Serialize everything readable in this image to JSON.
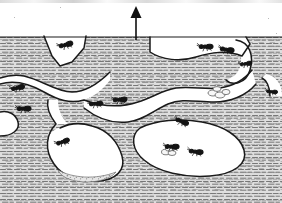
{
  "figure": {
    "width": 282,
    "height": 203,
    "background_color": "#ffffff",
    "soil_fill_color": "#d9d9d9",
    "soil_hatch_color": "#6e6e6e",
    "outline_color": "#1a1a1a",
    "ant_color": "#141414",
    "brood_color": "#f2f2f2",
    "debris_color": "#8a8a8a"
  },
  "annotations": {
    "direction_arrow": {
      "name": "up-arrow",
      "label": "",
      "meaning": "up / toward surface",
      "x": 136,
      "y_tip": 7,
      "y_tail": 40,
      "color": "#101010"
    }
  },
  "soil": {
    "surface_y": 37,
    "texture": "short horizontal dash hatching",
    "regions_note": "Excavated galleries and chambers appear as white voids within hatched soil."
  },
  "chambers": [
    {
      "name": "upper-entrance-tunnel",
      "cx": 66,
      "cy": 46,
      "note": "V-shaped shaft descending from surface"
    },
    {
      "name": "upper-right-gallery",
      "cx": 200,
      "cy": 52,
      "note": "broad horizontal gallery near surface"
    },
    {
      "name": "right-edge-tunnel",
      "cx": 258,
      "cy": 60,
      "note": "hooked tunnel at right margin"
    },
    {
      "name": "mid-left-gallery",
      "cx": 40,
      "cy": 95,
      "note": "horizontal gallery, left side"
    },
    {
      "name": "central-void",
      "cx": 120,
      "cy": 95,
      "note": "large white void spanning the middle"
    },
    {
      "name": "lower-left-chamber",
      "cx": 85,
      "cy": 155,
      "note": "rounded chamber with granular floor deposit"
    },
    {
      "name": "lower-right-chamber",
      "cx": 195,
      "cy": 150,
      "note": "large brood chamber"
    }
  ],
  "ants": [
    {
      "name": "ant-surface-shaft",
      "x": 66,
      "y": 45,
      "rot": -20,
      "scale": 1.0,
      "carrying": false
    },
    {
      "name": "ant-left-upper",
      "x": 18,
      "y": 88,
      "rot": -18,
      "scale": 0.95,
      "carrying": false
    },
    {
      "name": "ant-left-lower",
      "x": 24,
      "y": 109,
      "rot": -6,
      "scale": 1.0,
      "carrying": false
    },
    {
      "name": "ant-ridge-left",
      "x": 96,
      "y": 104,
      "rot": -10,
      "scale": 0.95,
      "carrying": false
    },
    {
      "name": "ant-ridge-mid",
      "x": 120,
      "y": 100,
      "rot": -8,
      "scale": 1.0,
      "carrying": false
    },
    {
      "name": "ant-gallery-left",
      "x": 206,
      "y": 47,
      "rot": -6,
      "scale": 1.0,
      "carrying": false
    },
    {
      "name": "ant-gallery-right",
      "x": 227,
      "y": 50,
      "rot": 4,
      "scale": 1.0,
      "carrying": false
    },
    {
      "name": "ant-upper-right-edge",
      "x": 246,
      "y": 64,
      "rot": -14,
      "scale": 0.85,
      "carrying": false
    },
    {
      "name": "ant-ceiling-hanging",
      "x": 182,
      "y": 122,
      "rot": 16,
      "scale": 0.95,
      "carrying": false
    },
    {
      "name": "ant-chamber-left-wall",
      "x": 63,
      "y": 142,
      "rot": -24,
      "scale": 0.95,
      "carrying": false
    },
    {
      "name": "ant-brood-nurse",
      "x": 172,
      "y": 147,
      "rot": -4,
      "scale": 1.0,
      "carrying": true
    },
    {
      "name": "ant-brood-chamber",
      "x": 196,
      "y": 152,
      "rot": 2,
      "scale": 1.0,
      "carrying": false
    },
    {
      "name": "ant-right-margin",
      "x": 272,
      "y": 92,
      "rot": 0,
      "scale": 0.8,
      "carrying": false
    }
  ],
  "brood_clusters": [
    {
      "name": "brood-cluster-upper",
      "x": 218,
      "y": 93,
      "w": 22,
      "h": 9
    },
    {
      "name": "brood-cluster-lower",
      "x": 168,
      "y": 151,
      "w": 16,
      "h": 7
    }
  ],
  "debris_deposits": [
    {
      "name": "granular-floor-deposit",
      "x": 60,
      "y": 168,
      "w": 58,
      "h": 10
    }
  ]
}
